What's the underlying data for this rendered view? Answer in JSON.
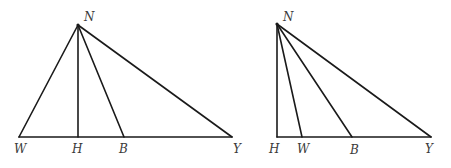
{
  "figures": [
    {
      "id": "left",
      "points": {
        "N": {
          "x": 78,
          "y": 25,
          "label": "N",
          "lx": 84,
          "ly": 21
        },
        "W": {
          "x": 19,
          "y": 137,
          "label": "W",
          "lx": 14,
          "ly": 153
        },
        "H": {
          "x": 78,
          "y": 137,
          "label": "H",
          "lx": 72,
          "ly": 153
        },
        "B": {
          "x": 124,
          "y": 137,
          "label": "B",
          "lx": 119,
          "ly": 153
        },
        "Y": {
          "x": 232,
          "y": 137,
          "label": "Y",
          "lx": 233,
          "ly": 153
        }
      },
      "segments": [
        [
          "N",
          "W"
        ],
        [
          "N",
          "H"
        ],
        [
          "N",
          "B"
        ],
        [
          "N",
          "Y"
        ],
        [
          "W",
          "Y"
        ]
      ]
    },
    {
      "id": "right",
      "points": {
        "N": {
          "x": 277,
          "y": 24,
          "label": "N",
          "lx": 283,
          "ly": 21
        },
        "H": {
          "x": 277,
          "y": 137,
          "label": "H",
          "lx": 269,
          "ly": 153
        },
        "W": {
          "x": 302,
          "y": 137,
          "label": "W",
          "lx": 297,
          "ly": 153
        },
        "B": {
          "x": 352,
          "y": 137,
          "label": "B",
          "lx": 350,
          "ly": 154
        },
        "Y": {
          "x": 431,
          "y": 137,
          "label": "Y",
          "lx": 425,
          "ly": 153
        }
      },
      "segments": [
        [
          "N",
          "H"
        ],
        [
          "N",
          "W"
        ],
        [
          "N",
          "B"
        ],
        [
          "N",
          "Y"
        ],
        [
          "H",
          "Y"
        ]
      ]
    }
  ],
  "labels": {
    "left": {
      "N": "N",
      "W": "W",
      "H": "H",
      "B": "B",
      "Y": "Y"
    },
    "right": {
      "N": "N",
      "H": "H",
      "W": "W",
      "B": "B",
      "Y": "Y"
    }
  }
}
